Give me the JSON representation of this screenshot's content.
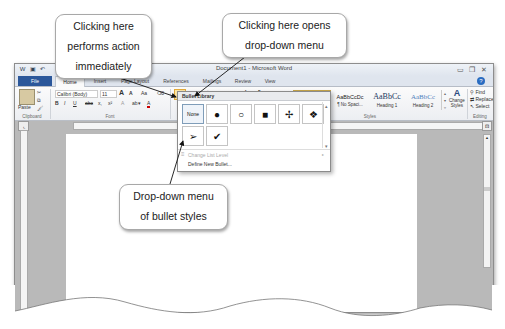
{
  "window": {
    "title": "Document1 - Microsoft Word",
    "qat_icons": [
      "word-icon",
      "save-icon",
      "undo-icon"
    ],
    "controls": [
      "minimize",
      "restore",
      "close"
    ]
  },
  "tabs": [
    {
      "label": "File"
    },
    {
      "label": "Home"
    },
    {
      "label": "Insert"
    },
    {
      "label": "Page Layout"
    },
    {
      "label": "References"
    },
    {
      "label": "Mailings"
    },
    {
      "label": "Review"
    },
    {
      "label": "View"
    }
  ],
  "ribbon": {
    "clipboard": {
      "paste": "Paste",
      "label": "Clipboard"
    },
    "font": {
      "name": "Calibri (Body)",
      "size": "11",
      "grow": "A",
      "shrink": "A",
      "change_case": "Aa",
      "bold": "B",
      "italic": "I",
      "underline": "U",
      "strikethrough": "abc",
      "subscript": "x,",
      "superscript": "x²",
      "label": "Font"
    },
    "paragraph": {
      "sort": "A↓",
      "pilcrow": "¶"
    },
    "styles": {
      "items": [
        {
          "sample": "AaBbCcDc",
          "name": "¶ Normal"
        },
        {
          "sample": "AaBbCcDc",
          "name": "¶ No Spaci..."
        },
        {
          "sample": "AaBbCc",
          "name": "Heading 1"
        },
        {
          "sample": "AaBbCc",
          "name": "Heading 2"
        }
      ],
      "change_styles": "Change Styles",
      "label": "Styles"
    },
    "editing": {
      "find": "Find",
      "replace": "Replace",
      "select": "Select",
      "label": "Editing"
    }
  },
  "bullet_library": {
    "header": "Bullet Library",
    "row1": [
      "None",
      "●",
      "○",
      "■",
      "✢",
      "❖"
    ],
    "row2": [
      "➢",
      "✔"
    ],
    "change_list_level": "Change List Level",
    "define_new_bullet": "Define New Bullet..."
  },
  "callouts": {
    "immediate": [
      "Clicking here",
      "performs action",
      "immediately"
    ],
    "dropdown": [
      "Clicking here opens",
      "drop-down menu"
    ],
    "menu": [
      "Drop-down menu",
      "of bullet styles"
    ]
  }
}
